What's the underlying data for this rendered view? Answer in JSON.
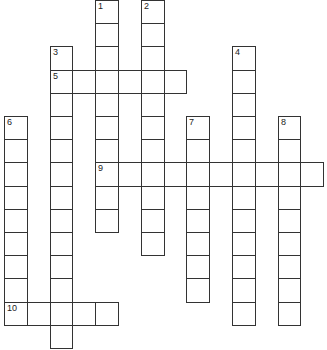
{
  "puzzle": {
    "type": "crossword",
    "cell_px": {
      "w": 22.8,
      "h": 23.2,
      "origin_x": 4,
      "origin_y": 0
    },
    "entries": [
      {
        "number": "1",
        "direction": "down",
        "row": 0,
        "col": 4,
        "length": 10
      },
      {
        "number": "2",
        "direction": "down",
        "row": 0,
        "col": 6,
        "length": 11
      },
      {
        "number": "3",
        "direction": "down",
        "row": 2,
        "col": 2,
        "length": 13
      },
      {
        "number": "4",
        "direction": "down",
        "row": 2,
        "col": 10,
        "length": 12
      },
      {
        "number": "5",
        "direction": "across",
        "row": 3,
        "col": 2,
        "length": 6
      },
      {
        "number": "6",
        "direction": "down",
        "row": 5,
        "col": 0,
        "length": 9
      },
      {
        "number": "7",
        "direction": "down",
        "row": 5,
        "col": 8,
        "length": 8
      },
      {
        "number": "8",
        "direction": "down",
        "row": 5,
        "col": 12,
        "length": 9
      },
      {
        "number": "9",
        "direction": "across",
        "row": 7,
        "col": 4,
        "length": 10
      },
      {
        "number": "10",
        "direction": "across",
        "row": 13,
        "col": 0,
        "length": 5
      }
    ]
  }
}
